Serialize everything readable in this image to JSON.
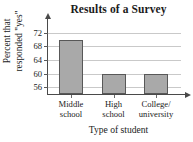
{
  "chart_data": {
    "type": "bar",
    "title": "Results of a Survey",
    "xlabel": "Type of student",
    "ylabel": "Percent that responded \"yes\"",
    "ylabel_line1": "Percent that",
    "ylabel_line2": "responded \"yes\"",
    "categories": [
      "Middle school",
      "High school",
      "College/ university"
    ],
    "category_lines": [
      [
        "Middle",
        "school"
      ],
      [
        "High",
        "school"
      ],
      [
        "College/",
        "university"
      ]
    ],
    "values": [
      70,
      60,
      60
    ],
    "yticks": [
      72,
      68,
      64,
      60,
      56
    ],
    "ylim": [
      54,
      74
    ],
    "grid": true,
    "legend": "none",
    "bar_fill_color": "#a9a9a9",
    "bar_edge_color": "#585858",
    "axis_color": "#4a4a4a",
    "grid_color": "#c9c9c9",
    "background_color": "#ffffff"
  }
}
